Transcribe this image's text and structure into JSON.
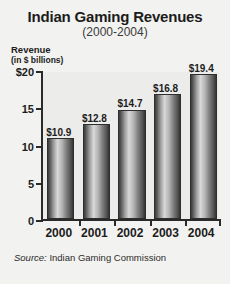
{
  "chart_data": {
    "type": "bar",
    "title": "Indian Gaming Revenues",
    "subtitle": "(2000-2004)",
    "ylabel": "Revenue",
    "ylabel_units": "(in $ billions)",
    "xlabel": "",
    "categories": [
      "2000",
      "2001",
      "2002",
      "2003",
      "2004"
    ],
    "values": [
      10.9,
      12.8,
      14.7,
      16.8,
      19.4
    ],
    "value_labels": [
      "$10.9",
      "$12.8",
      "$14.7",
      "$16.8",
      "$19.4"
    ],
    "ylim": [
      0,
      20
    ],
    "yticks": [
      0,
      5,
      10,
      15,
      20
    ],
    "ytick_labels": [
      "0",
      "5",
      "10",
      "15",
      "$20"
    ],
    "grid": false,
    "legend": null,
    "source_label": "Source:",
    "source_text": "Indian Gaming Commission",
    "colors": {
      "background": "#f2f2f0",
      "plot_background": "#ececeb",
      "axis": "#2a2a2a",
      "text": "#1c1c1c",
      "bar_dark": "#3c3c3c",
      "bar_light": "#d8d8d8"
    }
  }
}
